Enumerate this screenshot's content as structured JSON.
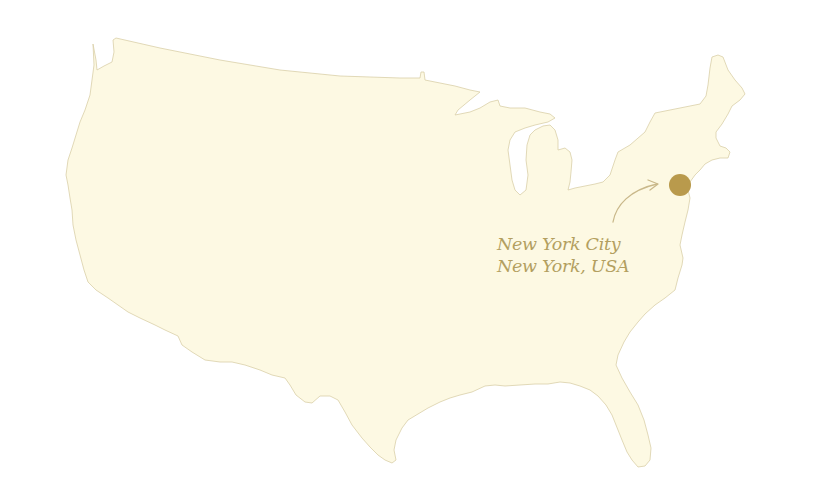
{
  "map": {
    "region": "Contiguous United States",
    "land_color": "#fdf9e3",
    "outline_color": "#d9cfa8",
    "marker_color": "#b99a4c",
    "label_color": "#b39f60"
  },
  "marker": {
    "name": "New York City",
    "label_line1": "New York City",
    "label_line2": "New York, USA",
    "icon": "location-dot-icon"
  }
}
